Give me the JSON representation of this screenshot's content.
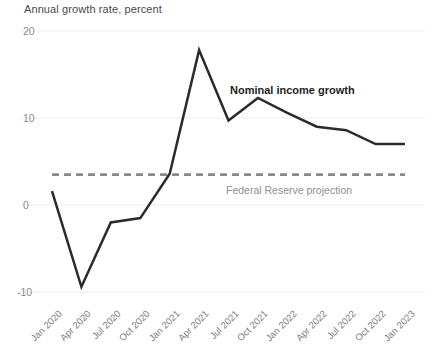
{
  "chart_data": {
    "type": "line",
    "title": "Annual growth rate, percent",
    "xlabel": "",
    "ylabel": "",
    "ylim": [
      -10,
      20
    ],
    "yticks": [
      20,
      10,
      0,
      -10
    ],
    "ytick_labels": [
      "20",
      "10",
      "0",
      "-10"
    ],
    "grid": true,
    "grid_axis": "y",
    "legend": "annotations",
    "categories": [
      "Jan 2020",
      "Apr 2020",
      "Jul 2020",
      "Oct 2020",
      "Jan 2021",
      "Apr 2021",
      "Jul 2021",
      "Oct 2021",
      "Jan 2022",
      "Apr 2022",
      "Jul 2022",
      "Oct 2022",
      "Jan 2023"
    ],
    "series": [
      {
        "name": "Nominal income growth",
        "color": "#2b2b2b",
        "style": "solid",
        "values": [
          1.6,
          -9.4,
          -2.0,
          -1.5,
          3.6,
          17.8,
          9.7,
          12.3,
          10.6,
          9.0,
          8.6,
          7.0,
          7.0
        ]
      },
      {
        "name": "Federal Reserve projection",
        "color": "#8a8a8a",
        "style": "dashed",
        "values": [
          3.5,
          3.5,
          3.5,
          3.5,
          3.5,
          3.5,
          3.5,
          3.5,
          3.5,
          3.5,
          3.5,
          3.5,
          3.5
        ]
      }
    ],
    "annotations": [
      {
        "text": "Nominal income growth",
        "x_px": 230,
        "y_px": 84,
        "color": "#1e1e1e",
        "bold": true
      },
      {
        "text": "Federal Reserve projection",
        "x_px": 226,
        "y_px": 184,
        "color": "#8f8f8f",
        "bold": false
      }
    ]
  },
  "colors": {
    "series_line": "#2b2b2b",
    "projection_line": "#8a8a8a",
    "gridline": "#ededed",
    "tick_text": "#8a8a8a",
    "title_text": "#4a4a4a",
    "background": "#ffffff"
  }
}
